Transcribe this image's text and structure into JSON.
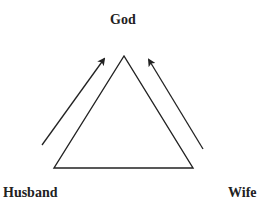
{
  "diagram": {
    "nodes": {
      "top": "God",
      "bottom_left": "Husband",
      "bottom_right": "Wife"
    },
    "shape": "triangle",
    "arrows": [
      {
        "from": "Husband",
        "to": "God",
        "side": "left"
      },
      {
        "from": "Wife",
        "to": "God",
        "side": "right"
      }
    ],
    "colors": {
      "stroke": "#222222",
      "text": "#222222",
      "background": "#ffffff"
    }
  }
}
